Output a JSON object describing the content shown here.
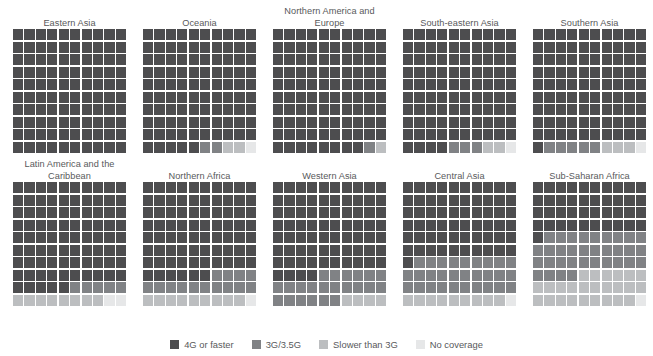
{
  "chart_data": {
    "type": "waffle",
    "title": "",
    "subtitle": "",
    "xlabel": "",
    "ylabel": "",
    "grid": false,
    "legend_position": "bottom",
    "unit": "percent of population",
    "cells_per_panel": 100,
    "grid_dimensions": "10x10",
    "fill_order": "top-left to bottom-right, row-major",
    "categories": [
      "4G or faster",
      "3G/3.5G",
      "Slower than 3G",
      "No coverage"
    ],
    "colors": {
      "4G or faster": "#4d4d4f",
      "3G/3.5G": "#808285",
      "Slower than 3G": "#bcbec0",
      "No coverage": "#e6e7e8"
    },
    "panels": [
      {
        "name": "Eastern Asia",
        "title": "Eastern Asia",
        "values": {
          "4G or faster": 100,
          "3G/3.5G": 0,
          "Slower than 3G": 0,
          "No coverage": 0
        }
      },
      {
        "name": "Oceania",
        "title": "Oceania",
        "values": {
          "4G or faster": 95,
          "3G/3.5G": 2,
          "Slower than 3G": 2,
          "No coverage": 1
        }
      },
      {
        "name": "Northern America and Europe",
        "title": "Northern America and\nEurope",
        "values": {
          "4G or faster": 98,
          "3G/3.5G": 1,
          "Slower than 3G": 1,
          "No coverage": 0
        }
      },
      {
        "name": "South-eastern Asia",
        "title": "South-eastern Asia",
        "values": {
          "4G or faster": 94,
          "3G/3.5G": 3,
          "Slower than 3G": 2,
          "No coverage": 1
        }
      },
      {
        "name": "Southern Asia",
        "title": "Southern Asia",
        "values": {
          "4G or faster": 91,
          "3G/3.5G": 5,
          "Slower than 3G": 3,
          "No coverage": 1
        }
      },
      {
        "name": "Latin America and the Caribbean",
        "title": "Latin America and the\nCaribbean",
        "values": {
          "4G or faster": 85,
          "3G/3.5G": 5,
          "Slower than 3G": 8,
          "No coverage": 2
        }
      },
      {
        "name": "Northern Africa",
        "title": "Northern Africa",
        "values": {
          "4G or faster": 76,
          "3G/3.5G": 14,
          "Slower than 3G": 9,
          "No coverage": 1
        }
      },
      {
        "name": "Western Asia",
        "title": "Western Asia",
        "values": {
          "4G or faster": 74,
          "3G/3.5G": 22,
          "Slower than 3G": 4,
          "No coverage": 0
        }
      },
      {
        "name": "Central Asia",
        "title": "Central Asia",
        "values": {
          "4G or faster": 61,
          "3G/3.5G": 29,
          "Slower than 3G": 9,
          "No coverage": 1
        }
      },
      {
        "name": "Sub-Saharan Africa",
        "title": "Sub-Saharan Africa",
        "values": {
          "4G or faster": 41,
          "3G/3.5G": 33,
          "Slower than 3G": 25,
          "No coverage": 1
        }
      }
    ],
    "legend": [
      {
        "label": "4G or faster",
        "color": "#4d4d4f"
      },
      {
        "label": "3G/3.5G",
        "color": "#808285"
      },
      {
        "label": "Slower than 3G",
        "color": "#bcbec0"
      },
      {
        "label": "No coverage",
        "color": "#e6e7e8"
      }
    ]
  }
}
